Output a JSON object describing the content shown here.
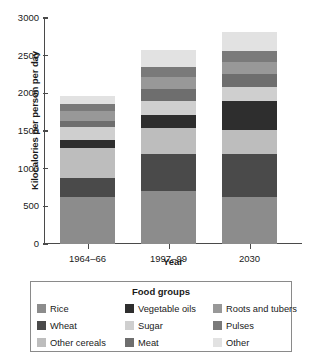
{
  "chart_data": {
    "type": "bar",
    "stacked": true,
    "title": "",
    "xlabel": "Year",
    "ylabel": "Kilocalories per person per day",
    "categories": [
      "1964–66",
      "1997–99",
      "2030"
    ],
    "ylim": [
      0,
      3000
    ],
    "ytick_labels": [
      "0",
      "500",
      "1000",
      "1500",
      "2000",
      "2500",
      "3000"
    ],
    "ytick_values": [
      0,
      500,
      1000,
      1500,
      2000,
      2500,
      3000
    ],
    "grid": false,
    "legend_position": "bottom",
    "legend_title": "Food groups",
    "series": [
      {
        "name": "Rice",
        "color": "#8c8c8c",
        "values": [
          620,
          700,
          620
        ]
      },
      {
        "name": "Wheat",
        "color": "#4a4a4a",
        "values": [
          255,
          490,
          575
        ]
      },
      {
        "name": "Other cereals",
        "color": "#bdbdbd",
        "values": [
          405,
          345,
          315
        ]
      },
      {
        "name": "Vegetable oils",
        "color": "#2e2e2e",
        "values": [
          100,
          180,
          385
        ]
      },
      {
        "name": "Sugar",
        "color": "#cfcfcf",
        "values": [
          180,
          190,
          195
        ]
      },
      {
        "name": "Meat",
        "color": "#6e6e6e",
        "values": [
          75,
          160,
          170
        ]
      },
      {
        "name": "Roots and tubers",
        "color": "#989898",
        "values": [
          135,
          155,
          160
        ]
      },
      {
        "name": "Pulses",
        "color": "#7a7a7a",
        "values": [
          95,
          130,
          145
        ]
      },
      {
        "name": "Other",
        "color": "#e2e2e2",
        "values": [
          105,
          220,
          255
        ]
      }
    ],
    "totals": [
      1970,
      2570,
      2820
    ]
  },
  "legend": {
    "title": "Food groups",
    "items": [
      {
        "label": "Rice",
        "color": "#8c8c8c"
      },
      {
        "label": "Vegetable oils",
        "color": "#2e2e2e"
      },
      {
        "label": "Roots and tubers",
        "color": "#989898"
      },
      {
        "label": "Wheat",
        "color": "#4a4a4a"
      },
      {
        "label": "Sugar",
        "color": "#cfcfcf"
      },
      {
        "label": "Pulses",
        "color": "#7a7a7a"
      },
      {
        "label": "Other cereals",
        "color": "#bdbdbd"
      },
      {
        "label": "Meat",
        "color": "#6e6e6e"
      },
      {
        "label": "Other",
        "color": "#e2e2e2"
      }
    ]
  }
}
